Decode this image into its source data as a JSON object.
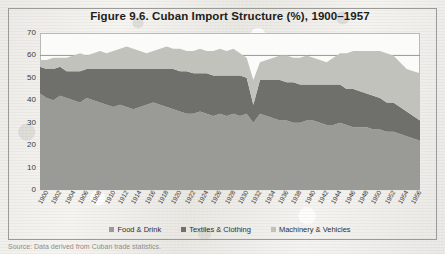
{
  "figure": {
    "title": "Figure 9.6. Cuban Import Structure (%), 1900–1957",
    "caption": "Source: Data derived from Cuban trade statistics."
  },
  "legend": {
    "position": "bottom",
    "items": [
      {
        "label": "Food & Drink",
        "color": "#9a9a96"
      },
      {
        "label": "Textiles & Clothing",
        "color": "#6f6f6c"
      },
      {
        "label": "Machinery & Vehicles",
        "color": "#c2c2bd"
      }
    ]
  },
  "axes": {
    "y_ticks": [
      "0",
      "10",
      "20",
      "30",
      "40",
      "50",
      "60",
      "70"
    ],
    "x_ticks": [
      "1900",
      "1902",
      "1904",
      "1906",
      "1908",
      "1910",
      "1912",
      "1914",
      "1916",
      "1918",
      "1920",
      "1922",
      "1924",
      "1926",
      "1928",
      "1930",
      "1932",
      "1934",
      "1936",
      "1938",
      "1940",
      "1942",
      "1944",
      "1946",
      "1948",
      "1950",
      "1952",
      "1954",
      "1956"
    ]
  },
  "chart_data": {
    "type": "area",
    "stacked": true,
    "title": "Figure 9.6. Cuban Import Structure (%), 1900–1957",
    "xlabel": "",
    "ylabel": "",
    "ylim": [
      0,
      70
    ],
    "xlim": [
      1900,
      1957
    ],
    "grid": true,
    "gridlines_y": [
      60
    ],
    "legend_position": "bottom",
    "x": [
      1900,
      1901,
      1902,
      1903,
      1904,
      1905,
      1906,
      1907,
      1908,
      1909,
      1910,
      1911,
      1912,
      1913,
      1914,
      1915,
      1916,
      1917,
      1918,
      1919,
      1920,
      1921,
      1922,
      1923,
      1924,
      1925,
      1926,
      1927,
      1928,
      1929,
      1930,
      1931,
      1932,
      1933,
      1934,
      1935,
      1936,
      1937,
      1938,
      1939,
      1940,
      1941,
      1942,
      1943,
      1944,
      1945,
      1946,
      1947,
      1948,
      1949,
      1950,
      1951,
      1952,
      1953,
      1954,
      1955,
      1956,
      1957
    ],
    "series": [
      {
        "name": "Food & Drink",
        "color": "#9a9a96",
        "values": [
          43,
          41,
          40,
          42,
          41,
          40,
          39,
          41,
          40,
          39,
          38,
          37,
          38,
          37,
          36,
          37,
          38,
          39,
          38,
          37,
          36,
          35,
          34,
          34,
          35,
          34,
          33,
          34,
          33,
          34,
          33,
          34,
          30,
          34,
          33,
          32,
          31,
          31,
          30,
          30,
          31,
          31,
          30,
          29,
          29,
          30,
          29,
          28,
          28,
          28,
          27,
          27,
          26,
          26,
          25,
          24,
          23,
          22
        ]
      },
      {
        "name": "Textiles & Clothing",
        "color": "#6f6f6c",
        "values": [
          12,
          13,
          14,
          13,
          12,
          13,
          14,
          13,
          14,
          15,
          16,
          17,
          16,
          17,
          18,
          17,
          16,
          15,
          16,
          17,
          18,
          18,
          19,
          18,
          17,
          18,
          18,
          17,
          18,
          17,
          18,
          16,
          8,
          15,
          16,
          17,
          18,
          17,
          18,
          17,
          16,
          16,
          17,
          18,
          18,
          17,
          16,
          17,
          16,
          15,
          15,
          14,
          13,
          13,
          12,
          11,
          10,
          9
        ]
      },
      {
        "name": "Machinery & Vehicles",
        "color": "#c2c2bd",
        "values": [
          3,
          4,
          5,
          4,
          6,
          7,
          8,
          6,
          7,
          8,
          7,
          8,
          9,
          10,
          9,
          8,
          7,
          8,
          9,
          10,
          9,
          10,
          9,
          10,
          11,
          10,
          11,
          12,
          11,
          12,
          10,
          9,
          11,
          8,
          9,
          10,
          11,
          12,
          11,
          12,
          13,
          12,
          11,
          10,
          12,
          14,
          16,
          17,
          18,
          19,
          20,
          21,
          22,
          21,
          20,
          19,
          20,
          21
        ]
      }
    ]
  }
}
